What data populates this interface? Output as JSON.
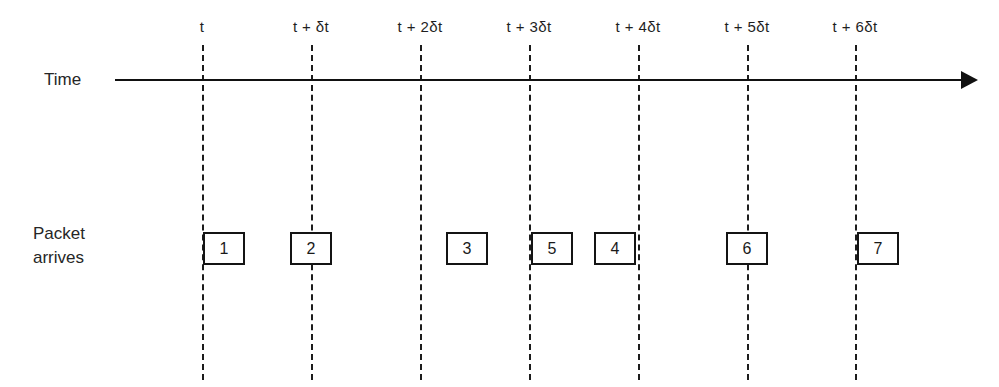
{
  "diagram": {
    "background_color": "#ffffff",
    "line_color": "#141414"
  },
  "axis": {
    "label": "Time",
    "arrow_direction": "right",
    "start_x": 115,
    "end_x": 978,
    "y": 80
  },
  "rows": {
    "packet_label": "Packet\narrives"
  },
  "ticks": [
    {
      "label": "t",
      "x": 202
    },
    {
      "label": "t + δt",
      "x": 311
    },
    {
      "label": "t + 2δt",
      "x": 420
    },
    {
      "label": "t + 3δt",
      "x": 529
    },
    {
      "label": "t + 4δt",
      "x": 638
    },
    {
      "label": "t + 5δt",
      "x": 747
    },
    {
      "label": "t + 6δt",
      "x": 855
    }
  ],
  "packets": [
    {
      "number": "1",
      "x": 203
    },
    {
      "number": "2",
      "x": 290
    },
    {
      "number": "3",
      "x": 446
    },
    {
      "number": "5",
      "x": 531
    },
    {
      "number": "4",
      "x": 594
    },
    {
      "number": "6",
      "x": 726
    },
    {
      "number": "7",
      "x": 857
    }
  ]
}
